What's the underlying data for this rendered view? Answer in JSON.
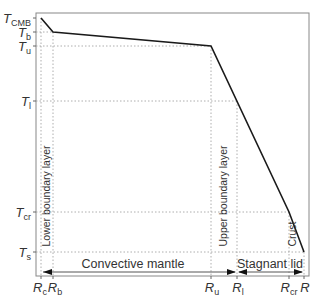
{
  "diagram": {
    "y_axis_labels": [
      {
        "id": "T_CMB",
        "base": "T",
        "sub": "CMB",
        "y": 18
      },
      {
        "id": "T_b",
        "base": "T",
        "sub": "b",
        "y": 32
      },
      {
        "id": "T_u",
        "base": "T",
        "sub": "u",
        "y": 46
      },
      {
        "id": "T_l",
        "base": "T",
        "sub": "l",
        "y": 101
      },
      {
        "id": "T_cr",
        "base": "T",
        "sub": "cr",
        "y": 212
      },
      {
        "id": "T_s",
        "base": "T",
        "sub": "s",
        "y": 252
      }
    ],
    "x_axis_labels": [
      {
        "id": "R_c",
        "base": "R",
        "sub": "c",
        "x": 41
      },
      {
        "id": "R_b",
        "base": "R",
        "sub": "b",
        "x": 53
      },
      {
        "id": "R_u",
        "base": "R",
        "sub": "u",
        "x": 211
      },
      {
        "id": "R_l",
        "base": "R",
        "sub": "l",
        "x": 237
      },
      {
        "id": "R_cr",
        "base": "R",
        "sub": "cr",
        "x": 289
      },
      {
        "id": "R",
        "base": "R",
        "sub": "",
        "x": 304
      }
    ],
    "profile_points": [
      [
        41,
        18
      ],
      [
        53,
        32
      ],
      [
        211,
        46
      ],
      [
        289,
        212
      ],
      [
        304,
        252
      ]
    ],
    "regions": {
      "convective_mantle": "Convective mantle",
      "stagnant_lid": "Stagnant lid",
      "lower_boundary_layer": "Lower boundary layer",
      "upper_boundary_layer": "Upper boundary layer",
      "crust": "Crust"
    },
    "colors": {
      "profile_line": "#1a1a1a",
      "axis": "#555555",
      "guide": "#999999",
      "text": "#333333"
    }
  }
}
